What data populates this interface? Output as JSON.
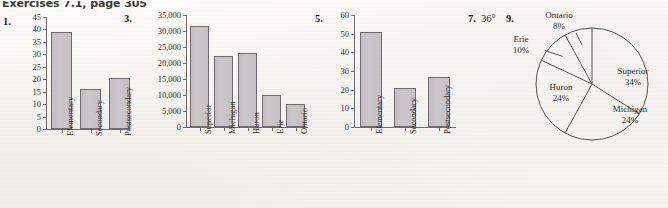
{
  "header": {
    "title": "Exercises 7.1, page 305"
  },
  "exercises": {
    "e1": "1.",
    "e3": "3.",
    "e5": "5.",
    "e7": "7.",
    "e7_answer": "36°",
    "e9": "9."
  },
  "chart_data": [
    {
      "id": "chart1",
      "type": "bar",
      "title": "",
      "xlabel": "",
      "ylabel": "",
      "categories": [
        "Elementary",
        "Secondary",
        "Postsecondary"
      ],
      "values": [
        39,
        16,
        20.5
      ],
      "ylim": [
        0,
        45
      ],
      "yticks": [
        0,
        5,
        10,
        15,
        20,
        25,
        30,
        35,
        40,
        45
      ],
      "ytick_labels": [
        "0",
        "5",
        "10",
        "15",
        "20",
        "25",
        "30",
        "35",
        "40",
        "45"
      ],
      "grid": false,
      "legend": "none"
    },
    {
      "id": "chart3",
      "type": "bar",
      "title": "",
      "xlabel": "",
      "ylabel": "",
      "categories": [
        "Superior",
        "Michigan",
        "Huron",
        "Erie",
        "Ontario"
      ],
      "values": [
        31700,
        22300,
        23000,
        9900,
        7300
      ],
      "ylim": [
        0,
        35000
      ],
      "yticks": [
        0,
        5000,
        10000,
        15000,
        20000,
        25000,
        30000,
        35000
      ],
      "ytick_labels": [
        "0",
        "5,000",
        "10,000",
        "15,000",
        "20,000",
        "25,000",
        "30,000",
        "35,000"
      ],
      "grid": false,
      "legend": "none"
    },
    {
      "id": "chart5",
      "type": "bar",
      "title": "",
      "xlabel": "",
      "ylabel": "",
      "categories": [
        "Elementary",
        "Secondary",
        "Postsecondary"
      ],
      "values": [
        51,
        21,
        27
      ],
      "ylim": [
        0,
        60
      ],
      "yticks": [
        0,
        10,
        20,
        30,
        40,
        50,
        60
      ],
      "ytick_labels": [
        "0",
        "10",
        "20",
        "30",
        "40",
        "50",
        "60"
      ],
      "grid": false,
      "legend": "none"
    },
    {
      "id": "chart9",
      "type": "pie",
      "title": "",
      "categories": [
        "Superior",
        "Michigan",
        "Huron",
        "Erie",
        "Ontario"
      ],
      "values": [
        34,
        24,
        24,
        10,
        8
      ],
      "labels": [
        "Superior",
        "Michigan",
        "Huron",
        "Erie",
        "Ontario"
      ],
      "value_labels": [
        "34%",
        "24%",
        "24%",
        "10%",
        "8%"
      ],
      "start_angle_deg": 0,
      "direction": "clockwise",
      "legend": "labels-on-slices"
    }
  ],
  "colors": {
    "bar_fill": "#c8c2c7",
    "bar_stroke": "#6e6a70",
    "axis": "#6f6c68",
    "text": "#2b2b2b",
    "page_background": "#f8f6f2"
  }
}
